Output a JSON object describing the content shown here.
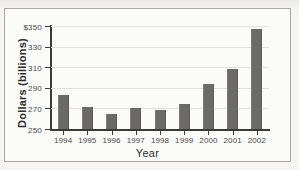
{
  "figure": {
    "border_color": "#a9a8a4",
    "background": "#fbfbfa",
    "page_background": "#f1f0ec"
  },
  "chart_data": {
    "type": "bar",
    "title": "",
    "subtitle": "",
    "xlabel": "Year",
    "ylabel": "Dollars (billions)",
    "categories": [
      "1994",
      "1995",
      "1996",
      "1997",
      "1998",
      "1999",
      "2000",
      "2001",
      "2002"
    ],
    "values": [
      283,
      271,
      265,
      270,
      268,
      274,
      294,
      308,
      347
    ],
    "ylim": [
      250,
      350
    ],
    "ytick_values": [
      250,
      270,
      290,
      310,
      330,
      350
    ],
    "ytick_labels": [
      "250",
      "270",
      "290",
      "310",
      "330",
      "$350"
    ],
    "grid": true,
    "grid_axis": "y",
    "grid_color": "#e2e1dd",
    "legend": null,
    "legend_position": "none",
    "bar_color": "#6b6a68",
    "axis_color": "#3a3a38",
    "bars": [
      {
        "category": "1994",
        "value": 283
      },
      {
        "category": "1995",
        "value": 271
      },
      {
        "category": "1996",
        "value": 265
      },
      {
        "category": "1997",
        "value": 270
      },
      {
        "category": "1998",
        "value": 268
      },
      {
        "category": "1999",
        "value": 274
      },
      {
        "category": "2000",
        "value": 294
      },
      {
        "category": "2001",
        "value": 308
      },
      {
        "category": "2002",
        "value": 347
      }
    ]
  }
}
